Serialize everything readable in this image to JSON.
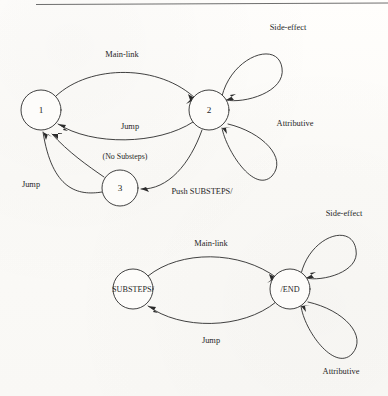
{
  "page": {
    "background_color": "#fdfcfa",
    "ink_color": "#2b2b2b"
  },
  "diagrams": [
    {
      "id": "top-diagram",
      "nodes": [
        {
          "id": "n1",
          "label": "1",
          "cx": 41,
          "cy": 110,
          "r": 20
        },
        {
          "id": "n2",
          "label": "2",
          "cx": 209,
          "cy": 110,
          "r": 20
        },
        {
          "id": "n3",
          "label": "3",
          "cx": 120,
          "cy": 188,
          "r": 18
        }
      ],
      "edges": [
        {
          "id": "e-main-link",
          "label": "Main-link",
          "from": "n1",
          "to": "n2",
          "label_x": 122,
          "label_y": 55
        },
        {
          "id": "e-jump-21",
          "label": "Jump",
          "from": "n2",
          "to": "n1",
          "label_x": 130,
          "label_y": 127
        },
        {
          "id": "e-no-substeps",
          "label": "(No Substeps)",
          "from": "n3",
          "to": "n1",
          "label_x": 125,
          "label_y": 157
        },
        {
          "id": "e-jump-31",
          "label": "Jump",
          "from": "n3",
          "to": "n1",
          "label_x": 31,
          "label_y": 185
        },
        {
          "id": "e-push-substeps",
          "label": "Push  SUBSTEPS/",
          "from": "n2",
          "to": "n3",
          "label_x": 202,
          "label_y": 192
        }
      ],
      "self_loops": [
        {
          "id": "loop-side-effect",
          "label": "Side-effect",
          "node": "n2",
          "label_x": 288,
          "label_y": 28
        },
        {
          "id": "loop-attributive",
          "label": "Attributive",
          "node": "n2",
          "label_x": 295,
          "label_y": 124
        }
      ]
    },
    {
      "id": "bottom-diagram",
      "nodes": [
        {
          "id": "nsub",
          "label": "SUBSTEPS/",
          "cx": 133,
          "cy": 289,
          "r": 20
        },
        {
          "id": "nend",
          "label": "/END",
          "cx": 290,
          "cy": 289,
          "r": 20
        }
      ],
      "edges": [
        {
          "id": "e-main-link-2",
          "label": "Main-link",
          "from": "nsub",
          "to": "nend",
          "label_x": 211,
          "label_y": 244
        },
        {
          "id": "e-jump-2",
          "label": "Jump",
          "from": "nend",
          "to": "nsub",
          "label_x": 211,
          "label_y": 341
        }
      ],
      "self_loops": [
        {
          "id": "loop-side-effect-2",
          "label": "Side-effect",
          "node": "nend",
          "label_x": 344,
          "label_y": 214
        },
        {
          "id": "loop-attributive-2",
          "label": "Attributive",
          "node": "nend",
          "label_x": 341,
          "label_y": 372
        }
      ]
    }
  ]
}
